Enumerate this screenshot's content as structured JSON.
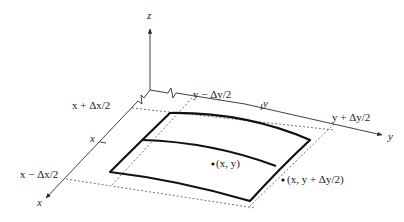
{
  "figure": {
    "axes": {
      "z_label": "z",
      "y_label": "y",
      "x_label": "x"
    },
    "x_ticks": {
      "upper": "x + Δx/2",
      "middle": "x",
      "lower": "x − Δx/2"
    },
    "y_ticks": {
      "left": "y − Δy/2",
      "middle": "y",
      "right": "y + Δy/2"
    },
    "points": {
      "center": "(x, y)",
      "edge": "(x, y + Δy/2)"
    },
    "colors": {
      "background": "#ffffff",
      "line": "#111111",
      "text": "#1a1a1a"
    }
  }
}
